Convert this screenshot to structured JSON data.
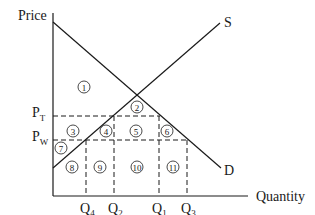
{
  "diagram": {
    "type": "supply-demand-tariff",
    "axes": {
      "y_label": "Price",
      "x_label": "Quantity"
    },
    "curves": {
      "supply_label": "S",
      "demand_label": "D"
    },
    "price_levels": [
      {
        "main": "P",
        "sub": "T"
      },
      {
        "main": "P",
        "sub": "W"
      }
    ],
    "quantity_levels": [
      {
        "main": "Q",
        "sub": "4"
      },
      {
        "main": "Q",
        "sub": "2"
      },
      {
        "main": "Q",
        "sub": "1"
      },
      {
        "main": "Q",
        "sub": "3"
      }
    ],
    "areas": [
      "1",
      "2",
      "3",
      "4",
      "5",
      "6",
      "7",
      "8",
      "9",
      "10",
      "11"
    ],
    "colors": {
      "line": "#1a1a1a",
      "background": "#ffffff"
    }
  }
}
